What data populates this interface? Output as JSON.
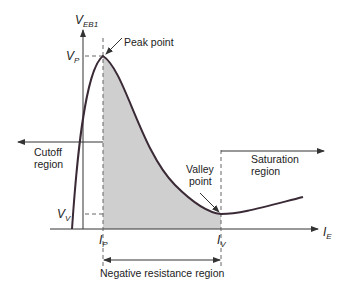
{
  "diagram": {
    "y_axis": {
      "label_main": "V",
      "label_sub": "EB1"
    },
    "x_axis": {
      "label_main": "I",
      "label_sub": "E"
    },
    "levels": {
      "vp": {
        "main": "V",
        "sub": "P"
      },
      "vv": {
        "main": "V",
        "sub": "V"
      },
      "ip": {
        "main": "I",
        "sub": "P"
      },
      "iv": {
        "main": "I",
        "sub": "V"
      }
    },
    "annotations": {
      "peak_point": "Peak point",
      "valley_point_line1": "Valley",
      "valley_point_line2": "point",
      "cutoff_line1": "Cutoff",
      "cutoff_line2": "region",
      "saturation_line1": "Saturation",
      "saturation_line2": "region",
      "negative_resistance": "Negative resistance region"
    },
    "colors": {
      "curve": "#3a2a35",
      "shade": "#cfcfcf",
      "axis": "#333333",
      "dashed": "#666666"
    }
  }
}
